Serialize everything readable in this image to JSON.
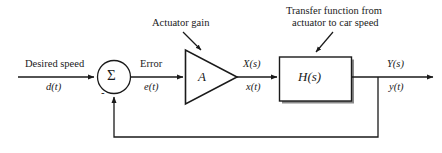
{
  "diagram": {
    "colors": {
      "line": "#1a1a1a",
      "text": "#1a1a1a",
      "background": "#ffffff",
      "shadow": "#8a8a8a",
      "block_fill": "#ffffff"
    },
    "input": {
      "label_top": "Desired speed",
      "label_bottom": "d(t)"
    },
    "summing_junction": {
      "symbol": "Σ",
      "negative_sign": "-"
    },
    "error_signal": {
      "label_top": "Error",
      "label_bottom": "e(t)"
    },
    "amplifier": {
      "symbol": "A",
      "annotation": "Actuator gain"
    },
    "actuator_signal": {
      "label_top": "X(s)",
      "label_bottom": "x(t)"
    },
    "plant": {
      "symbol": "H(s)",
      "annotation_line1": "Transfer function from",
      "annotation_line2": "actuator to car speed"
    },
    "output": {
      "label_top": "Y(s)",
      "label_bottom": "y(t)"
    }
  }
}
